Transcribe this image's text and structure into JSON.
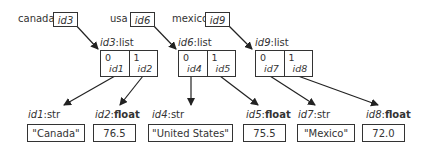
{
  "variables": [
    {
      "name": "canada",
      "ref": "id3"
    },
    {
      "name": "usa",
      "ref": "id6"
    },
    {
      "name": "mexico",
      "ref": "id9"
    }
  ],
  "lists": [
    {
      "id": "id3",
      "type": "list",
      "cells": [
        {
          "index": "0",
          "ref": "id1"
        },
        {
          "index": "1",
          "ref": "id2"
        }
      ]
    },
    {
      "id": "id6",
      "type": "list",
      "cells": [
        {
          "index": "0",
          "ref": "id4"
        },
        {
          "index": "1",
          "ref": "id5"
        }
      ]
    },
    {
      "id": "id9",
      "type": "list",
      "cells": [
        {
          "index": "0",
          "ref": "id7"
        },
        {
          "index": "1",
          "ref": "id8"
        }
      ]
    }
  ],
  "values": [
    {
      "id": "id1",
      "type": "str",
      "value": "\"Canada\""
    },
    {
      "id": "id2",
      "type": "float",
      "value": "76.5"
    },
    {
      "id": "id4",
      "type": "str",
      "value": "\"United States\""
    },
    {
      "id": "id5",
      "type": "float",
      "value": "75.5"
    },
    {
      "id": "id7",
      "type": "str",
      "value": "\"Mexico\""
    },
    {
      "id": "id8",
      "type": "float",
      "value": "72.0"
    }
  ],
  "colors": {
    "stroke": "#333333",
    "background": "#ffffff"
  }
}
